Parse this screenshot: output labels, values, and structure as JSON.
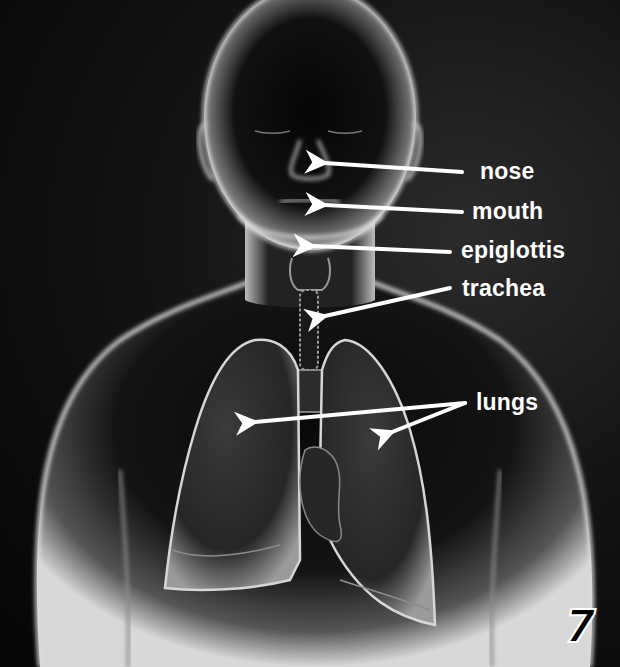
{
  "diagram": {
    "colors": {
      "background": "#0a0a0a",
      "body_glow": "#e8e8e8",
      "label": "#ffffff",
      "arrow": "#ffffff"
    },
    "labels": [
      {
        "id": "nose",
        "text": "nose",
        "x": 480,
        "y": 160,
        "arrow_from": [
          462,
          172
        ],
        "arrow_to": [
          [
            318,
            163
          ]
        ]
      },
      {
        "id": "mouth",
        "text": "mouth",
        "x": 472,
        "y": 200,
        "arrow_from": [
          462,
          212
        ],
        "arrow_to": [
          [
            318,
            205
          ]
        ]
      },
      {
        "id": "epiglottis",
        "text": "epiglottis",
        "x": 461,
        "y": 239,
        "arrow_from": [
          450,
          252
        ],
        "arrow_to": [
          [
            306,
            246
          ]
        ]
      },
      {
        "id": "trachea",
        "text": "trachea",
        "x": 462,
        "y": 277,
        "arrow_from": [
          450,
          288
        ],
        "arrow_to": [
          [
            318,
            318
          ]
        ]
      },
      {
        "id": "lungs",
        "text": "lungs",
        "x": 476,
        "y": 391,
        "arrow_from": [
          465,
          403
        ],
        "arrow_to": [
          [
            248,
            423
          ],
          [
            386,
            435
          ]
        ]
      }
    ],
    "page_number": "7"
  }
}
